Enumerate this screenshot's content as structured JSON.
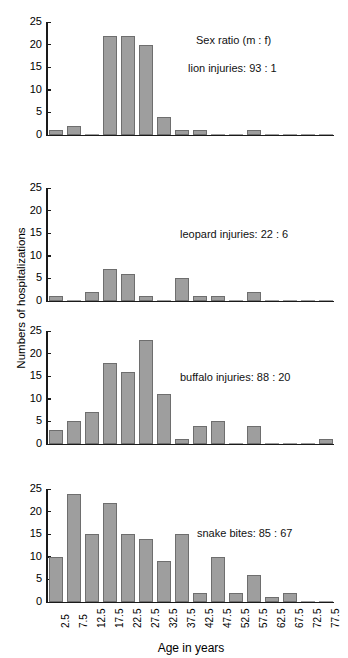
{
  "chart_data": {
    "type": "bar",
    "title": "",
    "xlabel": "Age in years",
    "ylabel": "Numbers of hospitalizations",
    "categories": [
      "2.5",
      "7.5",
      "12.5",
      "17.5",
      "22.5",
      "27.5",
      "32.5",
      "37.5",
      "42.5",
      "47.5",
      "52.5",
      "57.5",
      "62.5",
      "67.5",
      "72.5",
      "77.5"
    ],
    "ylim": [
      0,
      25
    ],
    "yticks": [
      0,
      5,
      10,
      15,
      20,
      25
    ],
    "grid": false,
    "legend_position": "none",
    "header_annotation": "Sex ratio (m : f)",
    "panels": [
      {
        "name": "lion",
        "annotation": "lion injuries:  93 : 1",
        "sex_ratio_male": 93,
        "sex_ratio_female": 1,
        "values": [
          1,
          2,
          0,
          22,
          22,
          20,
          4,
          1,
          1,
          0,
          0,
          1,
          0,
          0,
          0,
          0
        ]
      },
      {
        "name": "leopard",
        "annotation": "leopard injuries:  22 : 6",
        "sex_ratio_male": 22,
        "sex_ratio_female": 6,
        "values": [
          1,
          0,
          2,
          7,
          6,
          1,
          0,
          5,
          1,
          1,
          0,
          2,
          0,
          0,
          0,
          0
        ]
      },
      {
        "name": "buffalo",
        "annotation": "buffalo injuries:  88 : 20",
        "sex_ratio_male": 88,
        "sex_ratio_female": 20,
        "values": [
          3,
          5,
          7,
          18,
          16,
          23,
          11,
          1,
          4,
          5,
          0,
          4,
          0,
          0,
          0,
          1
        ]
      },
      {
        "name": "snake",
        "annotation": "snake bites:  85 : 67",
        "sex_ratio_male": 85,
        "sex_ratio_female": 67,
        "values": [
          10,
          24,
          15,
          22,
          15,
          14,
          9,
          15,
          2,
          10,
          2,
          6,
          1,
          2,
          0,
          0
        ]
      }
    ],
    "colors": {
      "bar_fill": "#9e9e9e",
      "bar_edge": "#6e6e6e",
      "axis": "#1a1a1a",
      "text": "#000000",
      "background": "#ffffff"
    }
  }
}
